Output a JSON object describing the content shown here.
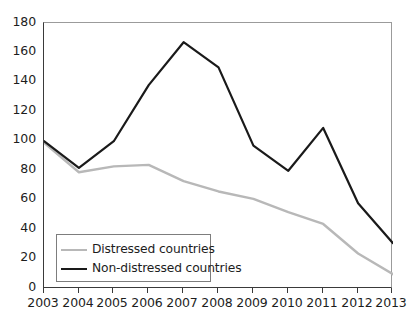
{
  "chart_data": {
    "type": "line",
    "title": "",
    "subtitle": "",
    "xlabel": "",
    "ylabel": "",
    "categories": [
      "2003",
      "2004",
      "2005",
      "2006",
      "2007",
      "2008",
      "2009",
      "2010",
      "2011",
      "2012",
      "2013"
    ],
    "x": [
      2003,
      2004,
      2005,
      2006,
      2007,
      2008,
      2009,
      2010,
      2011,
      2012,
      2013
    ],
    "series": [
      {
        "name": "Distressed countries",
        "color": "#b8b8b8",
        "values": [
          99,
          79,
          83,
          84,
          73,
          66,
          61,
          52,
          44,
          24,
          10
        ]
      },
      {
        "name": "Non-distressed countries",
        "color": "#1a1a1a",
        "values": [
          100,
          82,
          100,
          138,
          167,
          150,
          97,
          80,
          109,
          58,
          31
        ]
      }
    ],
    "ylim": [
      0,
      180
    ],
    "ytick_values": [
      0,
      20,
      40,
      60,
      80,
      100,
      120,
      140,
      160,
      180
    ],
    "ytick_labels": [
      "0",
      "20",
      "40",
      "60",
      "80",
      "100",
      "120",
      "140",
      "160",
      "180"
    ],
    "xlim": [
      2003,
      2013
    ],
    "grid": false,
    "legend_position": "bottom-left"
  },
  "axes": {
    "y_labels": [
      "180",
      "160",
      "140",
      "120",
      "100",
      "80",
      "60",
      "40",
      "20",
      "0"
    ],
    "x_labels": [
      "2003",
      "2004",
      "2005",
      "2006",
      "2007",
      "2008",
      "2009",
      "2010",
      "2011",
      "2012",
      "2013"
    ]
  },
  "legend": {
    "entries": [
      {
        "label": "Distressed countries",
        "style": "gray"
      },
      {
        "label": "Non-distressed countries",
        "style": "black"
      }
    ]
  },
  "colors": {
    "distressed_line": "#b8b8b8",
    "non_distressed_line": "#1a1a1a",
    "axis": "#3a3a3a",
    "frame": "#9b9b9b",
    "text": "#1d1d1d",
    "background": "#ffffff"
  }
}
